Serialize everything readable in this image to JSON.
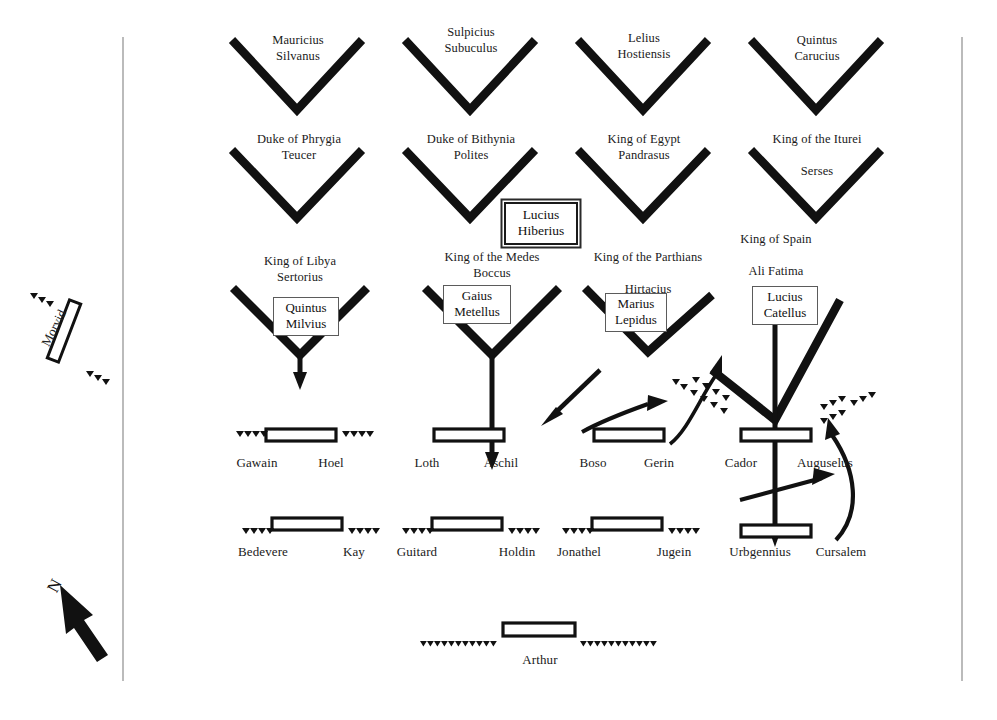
{
  "diagram": {
    "title_hidden": "",
    "colors": {
      "ink": "#111111",
      "line": "#1a1a1a",
      "frame": "#9a9a9a",
      "box_border": "#5b5b5b",
      "background": "#ffffff"
    },
    "compass": {
      "label": "N"
    },
    "flank_unit": {
      "name": "Morvid"
    },
    "roman_legions_row1": [
      {
        "id": "mauricius",
        "name": "Mauricius\nSilvanus"
      },
      {
        "id": "sulpicius",
        "name": "Sulpicius\nSubuculus"
      },
      {
        "id": "lelius",
        "name": "Lelius\nHostiensis"
      },
      {
        "id": "quintus-carucius",
        "name": "Quintus\nCarucius"
      }
    ],
    "roman_legions_row2": [
      {
        "id": "phrygia",
        "name": "Duke of Phrygia\nTeucer"
      },
      {
        "id": "bithynia",
        "name": "Duke of Bithynia\nPolites"
      },
      {
        "id": "egypt",
        "name": "King of Egypt\nPandrasus"
      },
      {
        "id": "iturei",
        "name": "King of the Iturei\n\nSerses"
      }
    ],
    "supreme_commander": {
      "name": "Lucius\nHiberius"
    },
    "roman_legions_row3": [
      {
        "id": "libya",
        "king": "King of Libya\nSertorius",
        "commander": "Quintus\nMilvius"
      },
      {
        "id": "medes",
        "king": "King of the Medes\nBoccus",
        "commander": "Gaius\nMetellus"
      },
      {
        "id": "parthians",
        "king": "King of the Parthians\n\nHirtacius",
        "commander": "Marius\nLepidus"
      },
      {
        "id": "spain",
        "king": "King of Spain\n\nAli Fatima",
        "commander": "Lucius\nCatellus"
      }
    ],
    "british_units_row1": [
      {
        "id": "gawain-hoel",
        "left": "Gawain",
        "right": "Hoel"
      },
      {
        "id": "loth-aschil",
        "left": "Loth",
        "right": "Aschil"
      },
      {
        "id": "boso-gerin",
        "left": "Boso",
        "right": "Gerin"
      },
      {
        "id": "cador-auguselus",
        "left": "Cador",
        "right": "Auguselus"
      }
    ],
    "british_units_row2": [
      {
        "id": "bedevere-kay",
        "left": "Bedevere",
        "right": "Kay"
      },
      {
        "id": "guitard-holdin",
        "left": "Guitard",
        "right": "Holdin"
      },
      {
        "id": "jonathel-jugein",
        "left": "Jonathel",
        "right": "Jugein"
      },
      {
        "id": "urbgennius-cursalem",
        "left": "Urbgennius",
        "right": "Cursalem"
      }
    ],
    "reserve_unit": {
      "name": "Arthur"
    }
  }
}
